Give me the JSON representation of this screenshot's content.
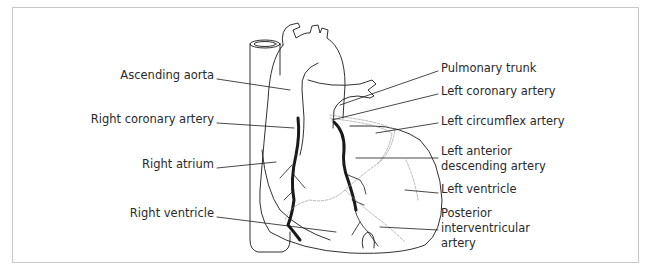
{
  "figure": {
    "labels_left": [
      {
        "id": "ascending-aorta",
        "text": "Ascending aorta"
      },
      {
        "id": "right-coronary-artery",
        "text": "Right coronary artery"
      },
      {
        "id": "right-atrium",
        "text": "Right atrium"
      },
      {
        "id": "right-ventricle",
        "text": "Right ventricle"
      }
    ],
    "labels_right": [
      {
        "id": "pulmonary-trunk",
        "text": "Pulmonary trunk"
      },
      {
        "id": "left-coronary-artery",
        "text": "Left coronary artery"
      },
      {
        "id": "left-circumflex-artery",
        "text": "Left circumflex artery"
      },
      {
        "id": "left-anterior-descending-artery",
        "lines": [
          "Left anterior",
          "descending artery"
        ]
      },
      {
        "id": "left-ventricle",
        "text": "Left ventricle"
      },
      {
        "id": "posterior-interventricular-artery",
        "lines": [
          "Posterior",
          "interventricular",
          "artery"
        ]
      }
    ],
    "colors": {
      "line": "#1a1a1a",
      "text": "#2a2a2a",
      "frame": "#c8c8c8",
      "dashed_vessel": "#9a9a9a"
    }
  }
}
